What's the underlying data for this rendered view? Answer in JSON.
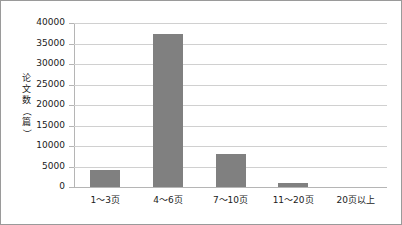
{
  "chart_data": {
    "type": "bar",
    "title": "",
    "xlabel": "",
    "ylabel": "论文数（篇）",
    "categories": [
      "1～3页",
      "4～6页",
      "7～10页",
      "11～20页",
      "20页以上"
    ],
    "values": [
      4200,
      37300,
      8000,
      1100,
      0
    ],
    "ylim": [
      0,
      40000
    ],
    "ytick_labels": [
      "40000",
      "35000",
      "30000",
      "25000",
      "20000",
      "15000",
      "10000",
      "5000",
      "0"
    ],
    "ytick_values": [
      40000,
      35000,
      30000,
      25000,
      20000,
      15000,
      10000,
      5000,
      0
    ],
    "grid": true,
    "legend": false,
    "bar_color": "#808080",
    "gridline_color": "#d0d0d0",
    "axis_color": "#b5b5b5",
    "border_color": "#9a9a9a",
    "series": [
      {
        "name": "论文数",
        "values": [
          4200,
          37300,
          8000,
          1100,
          0
        ]
      }
    ]
  },
  "ylabel_chars": [
    "论",
    "文",
    "数",
    "（",
    "篇",
    "）"
  ]
}
